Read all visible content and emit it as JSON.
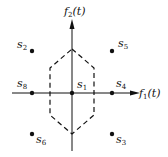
{
  "diagram": {
    "type": "signal-constellation",
    "axes": {
      "x_label": {
        "base": "f",
        "sub": "1",
        "arg": "(t)"
      },
      "y_label": {
        "base": "f",
        "sub": "2",
        "arg": "(t)"
      }
    },
    "points": [
      {
        "id": "s1",
        "base": "s",
        "sub": "1",
        "x": 72,
        "y": 93
      },
      {
        "id": "s2",
        "base": "s",
        "sub": "2",
        "x": 32,
        "y": 51
      },
      {
        "id": "s3",
        "base": "s",
        "sub": "3",
        "x": 112,
        "y": 134
      },
      {
        "id": "s4",
        "base": "s",
        "sub": "4",
        "x": 112,
        "y": 93
      },
      {
        "id": "s5",
        "base": "s",
        "sub": "5",
        "x": 112,
        "y": 51
      },
      {
        "id": "s6",
        "base": "s",
        "sub": "6",
        "x": 32,
        "y": 134
      },
      {
        "id": "s8",
        "base": "s",
        "sub": "8",
        "x": 32,
        "y": 93
      }
    ],
    "decision_region": {
      "shape": "hexagon",
      "style": "dashed",
      "around": "s1"
    }
  }
}
